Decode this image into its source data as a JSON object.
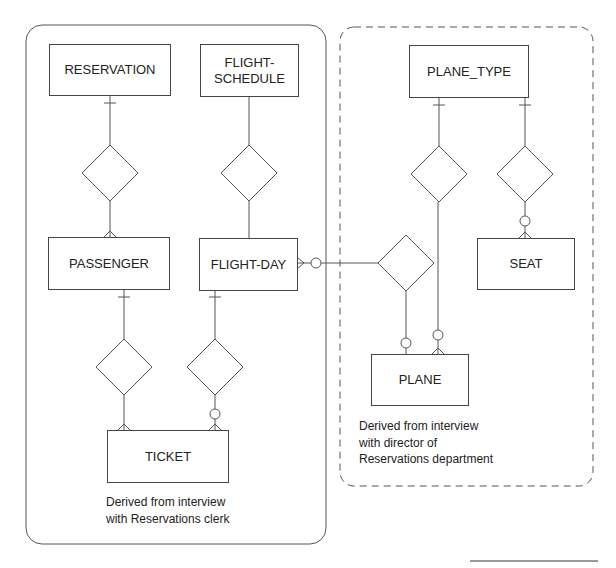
{
  "diagram": {
    "type": "entity-relationship",
    "left_group": {
      "style": "solid",
      "note_lines": [
        "Derived from interview",
        "with Reservations clerk"
      ]
    },
    "right_group": {
      "style": "dashed",
      "note_lines": [
        "Derived from interview",
        "with director of",
        "Reservations department"
      ]
    },
    "entities": {
      "reservation": "RESERVATION",
      "flight_schedule_1": "FLIGHT-",
      "flight_schedule_2": "SCHEDULE",
      "passenger": "PASSENGER",
      "flight_day": "FLIGHT-DAY",
      "ticket": "TICKET",
      "plane_type": "PLANE_TYPE",
      "seat": "SEAT",
      "plane": "PLANE"
    },
    "relationships": [
      {
        "from": "RESERVATION",
        "to": "PASSENGER",
        "from_card": "one",
        "to_card": "many"
      },
      {
        "from": "FLIGHT-SCHEDULE",
        "to": "FLIGHT-DAY",
        "from_card": "none",
        "to_card": "none"
      },
      {
        "from": "PASSENGER",
        "to": "TICKET",
        "from_card": "one",
        "to_card": "many"
      },
      {
        "from": "FLIGHT-DAY",
        "to": "TICKET",
        "from_card": "one",
        "to_card": "zero-or-many"
      },
      {
        "from": "FLIGHT-DAY",
        "to": "PLANE",
        "from_card": "zero-or-many",
        "to_card": "zero-or-one"
      },
      {
        "from": "PLANE_TYPE",
        "to": "PLANE",
        "from_card": "one",
        "to_card": "zero-or-many"
      },
      {
        "from": "PLANE_TYPE",
        "to": "SEAT",
        "from_card": "one",
        "to_card": "zero-or-many"
      }
    ]
  }
}
